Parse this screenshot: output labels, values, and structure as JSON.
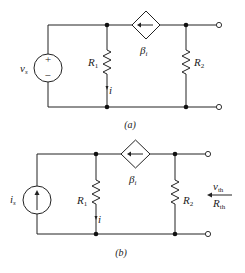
{
  "circuits": [
    {
      "id": "a",
      "caption": "(a)",
      "source": {
        "type": "voltage",
        "label_main": "v",
        "label_sub": "s",
        "plus": "+",
        "minus": "−"
      },
      "r1": {
        "label_main": "R",
        "label_sub": "1"
      },
      "r2": {
        "label_main": "R",
        "label_sub": "2"
      },
      "dependent_source": {
        "type": "current-controlled-current",
        "label_main": "β",
        "label_sub": "i",
        "arrow_direction": "left"
      },
      "current_label": "i"
    },
    {
      "id": "b",
      "caption": "(b)",
      "source": {
        "type": "current",
        "label_main": "i",
        "label_sub": "s",
        "arrow_direction": "up"
      },
      "r1": {
        "label_main": "R",
        "label_sub": "1"
      },
      "r2": {
        "label_main": "R",
        "label_sub": "2"
      },
      "dependent_source": {
        "type": "current-controlled-current",
        "label_main": "β",
        "label_sub": "i",
        "arrow_direction": "left"
      },
      "current_label": "i",
      "thevenin": {
        "v_main": "v",
        "v_sub": "th",
        "r_main": "R",
        "r_sub": "th"
      }
    }
  ]
}
